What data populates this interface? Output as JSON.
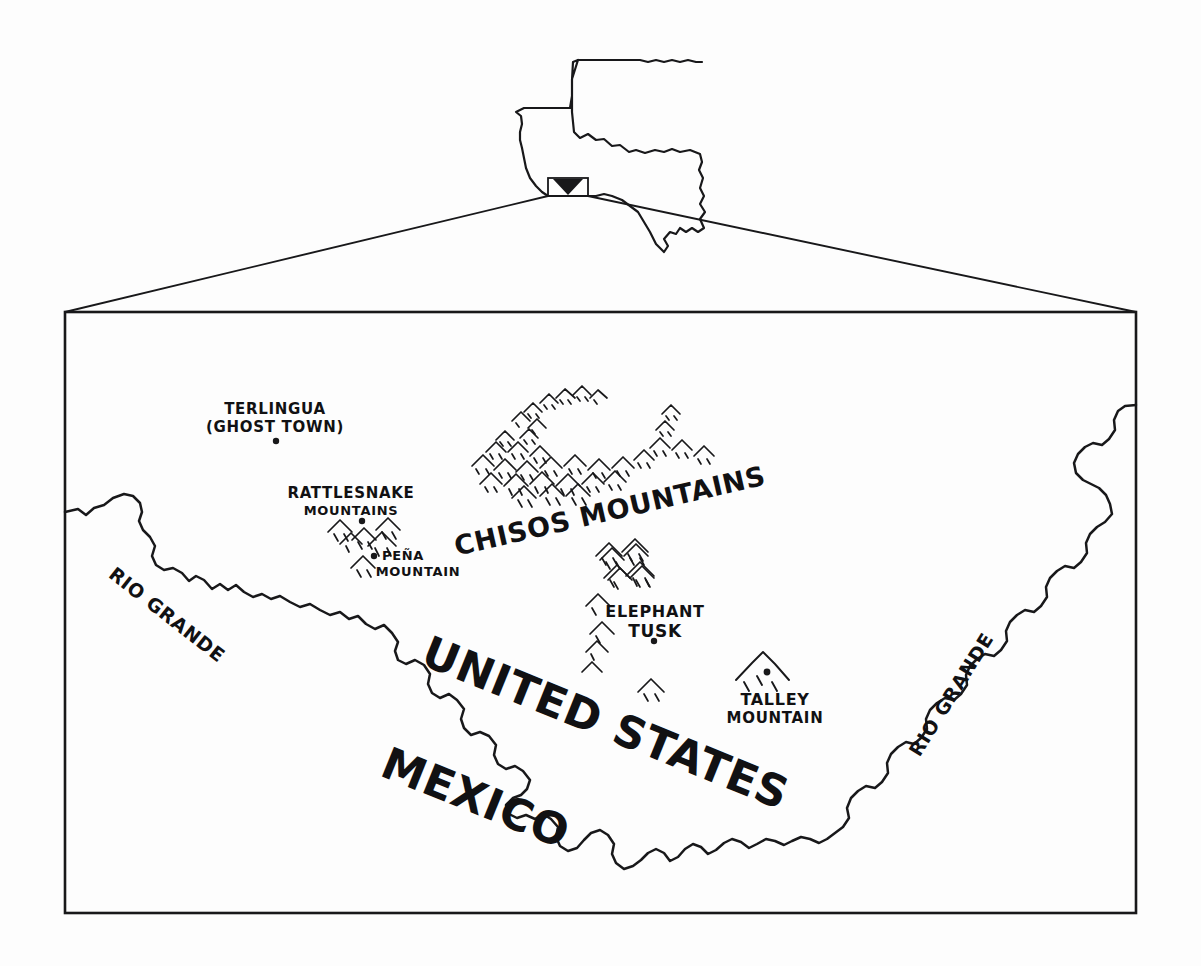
{
  "figure": {
    "kind": "hand-drawn-locator-map",
    "region": "Big Bend, Texas",
    "ink_color": "#18181a",
    "paper_color": "#ffffff"
  },
  "inset": {
    "name": "texas-state-outline",
    "marker_label": "",
    "marker_shape": "filled-triangle-in-box"
  },
  "frame": {
    "left": 65,
    "top": 312,
    "right": 1136,
    "bottom": 913
  },
  "places": [
    {
      "id": "terlingua",
      "lines": [
        "TERLINGUA",
        "(GHOST TOWN)"
      ],
      "x": 275,
      "y": 414,
      "font_size": 15,
      "rotate": 0,
      "anchor": "middle",
      "dot": {
        "x": 276,
        "y": 441
      },
      "type": "town"
    },
    {
      "id": "rattlesnake-mountains",
      "lines": [
        "RATTLESNAKE",
        "MOUNTAINS"
      ],
      "x": 351,
      "y": 498,
      "font_size": 14,
      "rotate": 0,
      "anchor": "middle",
      "dot": {
        "x": 362,
        "y": 521
      },
      "type": "range"
    },
    {
      "id": "pena-mountain",
      "lines": [
        "PEÑA",
        "MOUNTAIN"
      ],
      "x": 415,
      "y": 562,
      "font_size": 13,
      "rotate": 0,
      "anchor": "middle",
      "dot": {
        "x": 374,
        "y": 556
      },
      "type": "peak"
    },
    {
      "id": "chisos-mountains",
      "lines": [
        "CHISOS  MOUNTAINS"
      ],
      "x": 612,
      "y": 520,
      "font_size": 27,
      "rotate": -13,
      "anchor": "middle",
      "dot": null,
      "type": "range"
    },
    {
      "id": "elephant-tusk",
      "lines": [
        "ELEPHANT",
        "TUSK"
      ],
      "x": 655,
      "y": 617,
      "font_size": 16,
      "rotate": 0,
      "anchor": "middle",
      "dot": {
        "x": 654,
        "y": 641
      },
      "type": "peak"
    },
    {
      "id": "talley-mountain",
      "lines": [
        "TALLEY",
        "MOUNTAIN"
      ],
      "x": 775,
      "y": 705,
      "font_size": 15,
      "rotate": 0,
      "anchor": "middle",
      "dot": {
        "x": 767,
        "y": 672
      },
      "type": "peak"
    }
  ],
  "hydrography": [
    {
      "id": "rio-grande-west",
      "label": "RIO GRANDE",
      "x": 163,
      "y": 620,
      "font_size": 19,
      "rotate": 38,
      "anchor": "middle"
    },
    {
      "id": "rio-grande-east",
      "label": "RIO GRANDE",
      "x": 957,
      "y": 698,
      "font_size": 19,
      "rotate": -58,
      "anchor": "middle"
    }
  ],
  "countries": [
    {
      "id": "united-states",
      "label": "UNITED STATES",
      "x": 600,
      "y": 737,
      "font_size": 44,
      "rotate": 22,
      "anchor": "middle"
    },
    {
      "id": "mexico",
      "label": "MEXICO",
      "x": 470,
      "y": 812,
      "font_size": 44,
      "rotate": 22,
      "anchor": "middle"
    }
  ],
  "mountain_glyph_groups": [
    {
      "id": "rattlesnake-glyphs",
      "count": 5
    },
    {
      "id": "pena-glyph",
      "count": 1
    },
    {
      "id": "chisos-glyphs",
      "count": 34
    },
    {
      "id": "elephant-tusk-glyphs",
      "count": 9
    },
    {
      "id": "talley-glyph",
      "count": 1
    }
  ]
}
